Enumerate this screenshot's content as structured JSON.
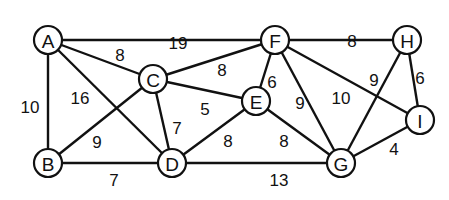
{
  "graph": {
    "type": "weighted-undirected-graph",
    "nodes": [
      {
        "id": "A",
        "x": 48,
        "y": 40
      },
      {
        "id": "F",
        "x": 275,
        "y": 40
      },
      {
        "id": "H",
        "x": 407,
        "y": 40
      },
      {
        "id": "C",
        "x": 153,
        "y": 79
      },
      {
        "id": "E",
        "x": 256,
        "y": 101
      },
      {
        "id": "I",
        "x": 420,
        "y": 120
      },
      {
        "id": "B",
        "x": 48,
        "y": 163
      },
      {
        "id": "D",
        "x": 172,
        "y": 163
      },
      {
        "id": "G",
        "x": 341,
        "y": 163
      }
    ],
    "edges": [
      {
        "from": "A",
        "to": "F",
        "weight": "19",
        "lx": 178,
        "ly": 43
      },
      {
        "from": "A",
        "to": "C",
        "weight": "8",
        "lx": 120,
        "ly": 55
      },
      {
        "from": "A",
        "to": "B",
        "weight": "10",
        "lx": 30,
        "ly": 107
      },
      {
        "from": "A",
        "to": "D",
        "weight": "16",
        "lx": 80,
        "ly": 98
      },
      {
        "from": "C",
        "to": "B",
        "weight": "9",
        "lx": 97,
        "ly": 142
      },
      {
        "from": "C",
        "to": "F",
        "weight": "8",
        "lx": 222,
        "ly": 70
      },
      {
        "from": "C",
        "to": "E",
        "weight": "5",
        "lx": 205,
        "ly": 109
      },
      {
        "from": "C",
        "to": "D",
        "weight": "7",
        "lx": 177,
        "ly": 128
      },
      {
        "from": "F",
        "to": "E",
        "weight": "6",
        "lx": 272,
        "ly": 82
      },
      {
        "from": "F",
        "to": "H",
        "weight": "8",
        "lx": 352,
        "ly": 41
      },
      {
        "from": "F",
        "to": "G",
        "weight": "9",
        "lx": 300,
        "ly": 103
      },
      {
        "from": "F",
        "to": "I",
        "weight": "10",
        "lx": 341,
        "ly": 98
      },
      {
        "from": "H",
        "to": "G",
        "weight": "9",
        "lx": 374,
        "ly": 80
      },
      {
        "from": "H",
        "to": "I",
        "weight": "6",
        "lx": 420,
        "ly": 78
      },
      {
        "from": "I",
        "to": "G",
        "weight": "4",
        "lx": 394,
        "ly": 149
      },
      {
        "from": "E",
        "to": "D",
        "weight": "8",
        "lx": 228,
        "ly": 141
      },
      {
        "from": "E",
        "to": "G",
        "weight": "8",
        "lx": 284,
        "ly": 141
      },
      {
        "from": "B",
        "to": "D",
        "weight": "7",
        "lx": 114,
        "ly": 180
      },
      {
        "from": "D",
        "to": "G",
        "weight": "13",
        "lx": 279,
        "ly": 180
      }
    ]
  }
}
